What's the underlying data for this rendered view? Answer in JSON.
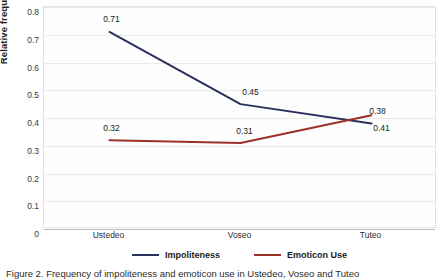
{
  "chart_data": {
    "type": "line",
    "title": "",
    "xlabel": "",
    "ylabel": "Relative frequency",
    "categories": [
      "Ustedeo",
      "Voseo",
      "Tuteo"
    ],
    "ylim": [
      0,
      0.8
    ],
    "y_ticks": [
      "0",
      "0.1",
      "0.2",
      "0.3",
      "0.4",
      "0.5",
      "0.6",
      "0.7",
      "0.8"
    ],
    "y_tick_values": [
      0,
      0.1,
      0.2,
      0.3,
      0.4,
      0.5,
      0.6,
      0.7,
      0.8
    ],
    "grid": true,
    "legend_position": "bottom",
    "series": [
      {
        "name": "Impoliteness",
        "color": "#29315c",
        "values": [
          0.71,
          0.45,
          0.38
        ],
        "labels": [
          "0.71",
          "0.45",
          "0.38"
        ]
      },
      {
        "name": "Emoticon Use",
        "color": "#9e3128",
        "values": [
          0.32,
          0.31,
          0.41
        ],
        "labels": [
          "0.32",
          "0.31",
          "0.41"
        ]
      }
    ]
  },
  "axis": {
    "y_title": "Relative frequency"
  },
  "legend": {
    "items": [
      {
        "label": "Impoliteness",
        "color": "#29315c"
      },
      {
        "label": "Emoticon Use",
        "color": "#9e3128"
      }
    ]
  },
  "caption": {
    "text": "Figure 2. Frequency of impoliteness and emoticon use in Ustedeo, Voseo and Tuteo"
  }
}
